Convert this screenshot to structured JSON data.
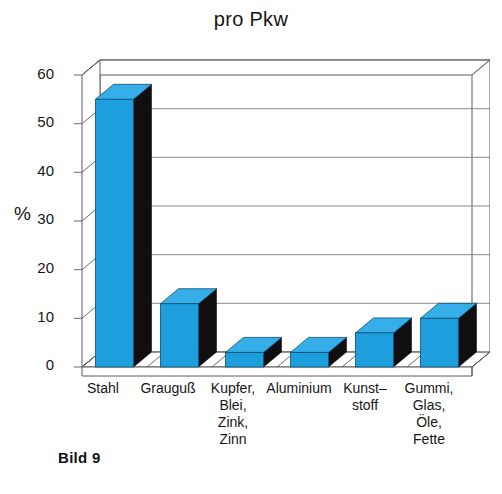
{
  "chart_data": {
    "type": "bar",
    "title": "pro Pkw",
    "xlabel": "",
    "ylabel": "%",
    "ylim": [
      0,
      60
    ],
    "yticks": [
      0,
      10,
      20,
      30,
      40,
      50,
      60
    ],
    "grid": true,
    "legend": "none",
    "style": "3d-column",
    "categories": [
      "Stahl",
      "Grauguß",
      "Kupfer,\nBlei,\nZink,\nZinn",
      "Aluminium",
      "Kunst–\nstoff",
      "Gummi,\nGlas,\nÖle,\nFette"
    ],
    "values": [
      55,
      13,
      3,
      3,
      7,
      10
    ],
    "series": [
      {
        "name": "Massenanteil pro Pkw",
        "values": [
          55,
          13,
          3,
          3,
          7,
          10
        ]
      }
    ]
  },
  "caption": {
    "text": "Bild 9"
  },
  "colors": {
    "bar_front": "#1e9fdd",
    "bar_top": "#35aee8",
    "bar_side": "#100e10",
    "axis_line": "#3a3a3a",
    "grid_line": "#6e6e6e",
    "background": "#ffffff",
    "text": "#161616"
  }
}
